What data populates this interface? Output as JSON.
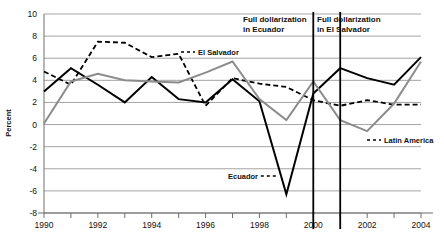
{
  "chart_data": {
    "type": "line",
    "title": "",
    "xlabel": "",
    "ylabel": "Percent",
    "x": [
      1990,
      1991,
      1992,
      1993,
      1994,
      1995,
      1996,
      1997,
      1998,
      1999,
      2000,
      2001,
      2002,
      2003,
      2004
    ],
    "xlim": [
      1990,
      2004
    ],
    "ylim": [
      -8,
      10
    ],
    "ytick_values": [
      10,
      8,
      6,
      4,
      2,
      0,
      -2,
      -4,
      -6,
      -8
    ],
    "ytick_labels": [
      "10",
      "8",
      "6",
      "4",
      "2",
      "0",
      "-2",
      "-4",
      "-6",
      "-8"
    ],
    "xtick_values": [
      1990,
      1991,
      1992,
      1993,
      1994,
      1995,
      1996,
      1997,
      1998,
      1999,
      2000,
      2001,
      2002,
      2003,
      2004
    ],
    "xtick_labels": [
      "1990",
      "",
      "1992",
      "",
      "1994",
      "",
      "1996",
      "",
      "1998",
      "",
      "2000",
      "",
      "2002",
      "",
      "2004"
    ],
    "grid": true,
    "legend_position": "inline-annotations",
    "series": [
      {
        "name": "Ecuador",
        "style": "solid",
        "color": "#000000",
        "width": 2.0,
        "values": [
          3.0,
          5.1,
          3.6,
          2.0,
          4.3,
          2.3,
          2.0,
          4.1,
          2.1,
          -6.3,
          2.8,
          5.1,
          4.2,
          3.6,
          6.1
        ]
      },
      {
        "name": "El Salvador",
        "style": "dashed",
        "color": "#000000",
        "width": 1.8,
        "values": [
          4.8,
          3.6,
          7.5,
          7.4,
          6.1,
          6.4,
          1.7,
          4.2,
          3.7,
          3.4,
          2.2,
          1.7,
          2.2,
          1.8,
          1.8
        ]
      },
      {
        "name": "Latin America",
        "style": "solid",
        "color": "#8c8c8c",
        "width": 2.0,
        "values": [
          0.1,
          3.9,
          4.6,
          4.0,
          3.9,
          3.8,
          4.7,
          5.7,
          2.3,
          0.4,
          3.9,
          0.4,
          -0.6,
          1.9,
          5.7
        ]
      }
    ],
    "annotations": [
      {
        "name": "el-salvador-label",
        "text": "El Salvador",
        "x_px": 198,
        "y_px": 55,
        "dash_prefix": true
      },
      {
        "name": "ecuador-label",
        "text": "Ecuador",
        "x_px": 228,
        "y_px": 179,
        "dash_suffix": true
      },
      {
        "name": "latin-america-label",
        "text": "Latin America",
        "x_px": 384,
        "y_px": 143,
        "dash_prefix": true
      }
    ],
    "event_lines": [
      {
        "name": "full-dollarization-ecuador",
        "x": 2000,
        "label_line1": "Full dollarization",
        "label_line2": "in Ecuador",
        "label_x_px": 243,
        "label_y_px": 22
      },
      {
        "name": "full-dollarization-el-salvador",
        "x": 2001,
        "label_line1": "Full dollarization",
        "label_line2": "in El Salvador",
        "label_x_px": 317,
        "label_y_px": 22
      }
    ],
    "colors": {
      "grid": "#9a9a9a",
      "axis": "#6e6e6e",
      "ecuador": "#000000",
      "el_salvador": "#000000",
      "latin_america": "#8c8c8c",
      "event_line": "#000000",
      "background": "#ffffff"
    }
  }
}
